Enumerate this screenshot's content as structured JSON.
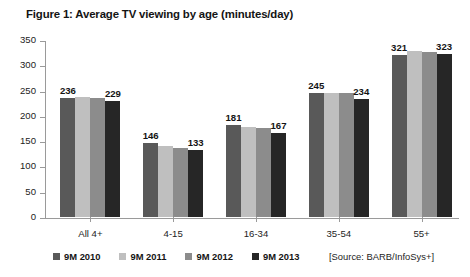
{
  "figure": {
    "title": "Figure 1: Average TV viewing by age (minutes/day)",
    "source": "[Source: BARB/InfoSys+]"
  },
  "chart_data": {
    "type": "bar",
    "title": "Figure 1: Average TV viewing by age (minutes/day)",
    "xlabel": "",
    "ylabel": "",
    "ylim": [
      0,
      350
    ],
    "yticks": [
      0,
      50,
      100,
      150,
      200,
      250,
      300,
      350
    ],
    "grid": false,
    "legend_position": "bottom-left",
    "categories": [
      "All 4+",
      "4-15",
      "16-34",
      "35-54",
      "55+"
    ],
    "series": [
      {
        "name": "9M 2010",
        "color": "#595959",
        "values": [
          236,
          146,
          181,
          245,
          321
        ]
      },
      {
        "name": "9M 2011",
        "color": "#bfbfbf",
        "values": [
          237,
          141,
          178,
          246,
          328
        ]
      },
      {
        "name": "9M 2012",
        "color": "#8c8c8c",
        "values": [
          236,
          137,
          177,
          245,
          327
        ]
      },
      {
        "name": "9M 2013",
        "color": "#262626",
        "values": [
          229,
          133,
          167,
          234,
          323
        ]
      }
    ],
    "annotations": [
      {
        "category": "All 4+",
        "series": "9M 2010",
        "text": "236"
      },
      {
        "category": "All 4+",
        "series": "9M 2013",
        "text": "229"
      },
      {
        "category": "4-15",
        "series": "9M 2010",
        "text": "146"
      },
      {
        "category": "4-15",
        "series": "9M 2013",
        "text": "133"
      },
      {
        "category": "16-34",
        "series": "9M 2010",
        "text": "181"
      },
      {
        "category": "16-34",
        "series": "9M 2013",
        "text": "167"
      },
      {
        "category": "35-54",
        "series": "9M 2010",
        "text": "245"
      },
      {
        "category": "35-54",
        "series": "9M 2013",
        "text": "234"
      },
      {
        "category": "55+",
        "series": "9M 2010",
        "text": "321"
      },
      {
        "category": "55+",
        "series": "9M 2013",
        "text": "323"
      }
    ]
  }
}
